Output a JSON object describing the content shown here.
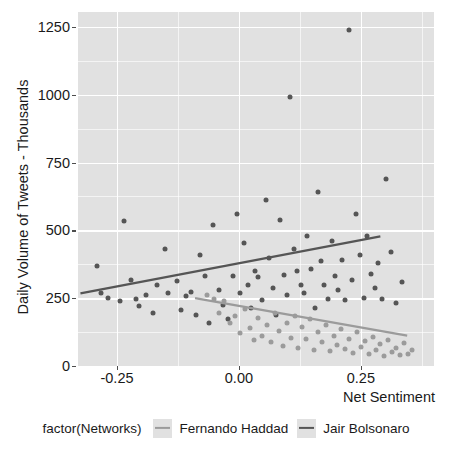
{
  "chart_data": {
    "type": "scatter",
    "title": "",
    "xlabel": "Net Sentiment",
    "ylabel": "Daily Volume of Tweets - Thousands",
    "xlim": [
      -0.33,
      0.4
    ],
    "ylim": [
      0,
      1305
    ],
    "xticks": [
      "-0.25",
      "0.00",
      "0.25"
    ],
    "xtick_values": [
      -0.25,
      0.0,
      0.25
    ],
    "yticks": [
      "0",
      "250",
      "500",
      "750",
      "1000",
      "1250"
    ],
    "ytick_values": [
      0,
      250,
      500,
      750,
      1000,
      1250
    ],
    "grid": true,
    "legend_position": "bottom",
    "legend_title": "factor(Networks)",
    "series": [
      {
        "name": "Jair Bolsonaro",
        "color": "#555555",
        "points": [
          [
            -0.292,
            370
          ],
          [
            -0.283,
            268
          ],
          [
            -0.268,
            252
          ],
          [
            -0.243,
            238
          ],
          [
            -0.236,
            533
          ],
          [
            -0.222,
            318
          ],
          [
            -0.212,
            248
          ],
          [
            -0.205,
            222
          ],
          [
            -0.191,
            262
          ],
          [
            -0.176,
            196
          ],
          [
            -0.168,
            300
          ],
          [
            -0.152,
            430
          ],
          [
            -0.146,
            268
          ],
          [
            -0.128,
            312
          ],
          [
            -0.118,
            206
          ],
          [
            -0.108,
            258
          ],
          [
            -0.098,
            272
          ],
          [
            -0.089,
            188
          ],
          [
            -0.08,
            410
          ],
          [
            -0.07,
            330
          ],
          [
            -0.062,
            160
          ],
          [
            -0.054,
            520
          ],
          [
            -0.04,
            282
          ],
          [
            -0.032,
            225
          ],
          [
            -0.022,
            172
          ],
          [
            -0.013,
            330
          ],
          [
            -0.004,
            560
          ],
          [
            0.003,
            268
          ],
          [
            0.01,
            455
          ],
          [
            0.018,
            300
          ],
          [
            0.024,
            214
          ],
          [
            0.032,
            350
          ],
          [
            0.04,
            328
          ],
          [
            0.047,
            242
          ],
          [
            0.055,
            612
          ],
          [
            0.062,
            398
          ],
          [
            0.07,
            286
          ],
          [
            0.076,
            189
          ],
          [
            0.084,
            540
          ],
          [
            0.092,
            336
          ],
          [
            0.098,
            262
          ],
          [
            0.104,
            990
          ],
          [
            0.112,
            432
          ],
          [
            0.12,
            352
          ],
          [
            0.127,
            300
          ],
          [
            0.134,
            268
          ],
          [
            0.14,
            480
          ],
          [
            0.148,
            358
          ],
          [
            0.155,
            214
          ],
          [
            0.162,
            640
          ],
          [
            0.168,
            388
          ],
          [
            0.175,
            300
          ],
          [
            0.182,
            246
          ],
          [
            0.19,
            462
          ],
          [
            0.196,
            332
          ],
          [
            0.204,
            280
          ],
          [
            0.212,
            392
          ],
          [
            0.218,
            244
          ],
          [
            0.225,
            1240
          ],
          [
            0.232,
            318
          ],
          [
            0.24,
            560
          ],
          [
            0.248,
            408
          ],
          [
            0.256,
            252
          ],
          [
            0.262,
            480
          ],
          [
            0.27,
            340
          ],
          [
            0.278,
            286
          ],
          [
            0.286,
            380
          ],
          [
            0.294,
            248
          ],
          [
            0.302,
            690
          ],
          [
            0.312,
            420
          ],
          [
            0.322,
            232
          ],
          [
            0.334,
            310
          ]
        ]
      },
      {
        "name": "Fernando Haddad",
        "color": "#9b9b9b",
        "points": [
          [
            -0.066,
            262
          ],
          [
            -0.052,
            248
          ],
          [
            -0.04,
            196
          ],
          [
            -0.03,
            240
          ],
          [
            -0.018,
            158
          ],
          [
            -0.008,
            186
          ],
          [
            0.002,
            120
          ],
          [
            0.012,
            210
          ],
          [
            0.022,
            140
          ],
          [
            0.03,
            96
          ],
          [
            0.04,
            178
          ],
          [
            0.048,
            112
          ],
          [
            0.058,
            150
          ],
          [
            0.066,
            88
          ],
          [
            0.074,
            196
          ],
          [
            0.082,
            128
          ],
          [
            0.09,
            72
          ],
          [
            0.098,
            158
          ],
          [
            0.106,
            104
          ],
          [
            0.114,
            186
          ],
          [
            0.122,
            66
          ],
          [
            0.13,
            142
          ],
          [
            0.138,
            98
          ],
          [
            0.146,
            172
          ],
          [
            0.154,
            60
          ],
          [
            0.162,
            126
          ],
          [
            0.17,
            88
          ],
          [
            0.178,
            150
          ],
          [
            0.186,
            54
          ],
          [
            0.194,
            112
          ],
          [
            0.202,
            76
          ],
          [
            0.21,
            138
          ],
          [
            0.218,
            62
          ],
          [
            0.226,
            100
          ],
          [
            0.234,
            48
          ],
          [
            0.242,
            124
          ],
          [
            0.25,
            70
          ],
          [
            0.258,
            92
          ],
          [
            0.266,
            44
          ],
          [
            0.274,
            108
          ],
          [
            0.282,
            58
          ],
          [
            0.29,
            80
          ],
          [
            0.298,
            38
          ],
          [
            0.306,
            96
          ],
          [
            0.314,
            52
          ],
          [
            0.322,
            68
          ],
          [
            0.33,
            40
          ],
          [
            0.338,
            84
          ],
          [
            0.346,
            46
          ],
          [
            0.354,
            60
          ]
        ]
      }
    ],
    "fit_lines": [
      {
        "name": "Jair Bolsonaro",
        "color": "#555555",
        "x0": -0.325,
        "y0": 268,
        "x1": 0.29,
        "y1": 478
      },
      {
        "name": "Fernando Haddad",
        "color": "#9b9b9b",
        "x0": -0.09,
        "y0": 250,
        "x1": 0.345,
        "y1": 112
      }
    ]
  },
  "axes": {
    "ylabel": "Daily Volume of Tweets - Thousands",
    "xlabel": "Net Sentiment",
    "yticks": [
      "1250",
      "1000",
      "750",
      "500",
      "250",
      "0"
    ],
    "xticks": [
      "-0.25",
      "0.00",
      "0.25"
    ]
  },
  "legend": {
    "title": "factor(Networks)",
    "items": [
      {
        "label": "Fernando Haddad",
        "color": "#9b9b9b"
      },
      {
        "label": "Jair Bolsonaro",
        "color": "#555555"
      }
    ]
  }
}
